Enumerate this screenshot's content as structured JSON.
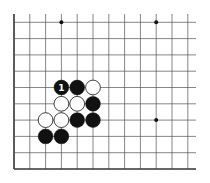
{
  "diagram": {
    "type": "go-board-fragment",
    "visible_columns": 12,
    "visible_rows": 10,
    "edges": [
      "left",
      "bottom"
    ],
    "star_points": [
      {
        "col": 3,
        "row": 0
      },
      {
        "col": 9,
        "row": 0
      },
      {
        "col": 9,
        "row": 6
      }
    ],
    "stones": [
      {
        "color": "black",
        "col": 3,
        "row": 4,
        "label": "1"
      },
      {
        "color": "black",
        "col": 4,
        "row": 4
      },
      {
        "color": "white",
        "col": 5,
        "row": 4
      },
      {
        "color": "white",
        "col": 3,
        "row": 5
      },
      {
        "color": "white",
        "col": 4,
        "row": 5
      },
      {
        "color": "black",
        "col": 5,
        "row": 5
      },
      {
        "color": "white",
        "col": 2,
        "row": 6
      },
      {
        "color": "white",
        "col": 3,
        "row": 6
      },
      {
        "color": "black",
        "col": 4,
        "row": 6
      },
      {
        "color": "black",
        "col": 5,
        "row": 6
      },
      {
        "color": "black",
        "col": 2,
        "row": 7
      },
      {
        "color": "black",
        "col": 3,
        "row": 7
      }
    ],
    "colors": {
      "line": "#555555",
      "edge": "#333333",
      "black_stone": "#111111",
      "white_stone": "#ffffff",
      "label_on_black": "#ffffff"
    }
  },
  "caption": ""
}
